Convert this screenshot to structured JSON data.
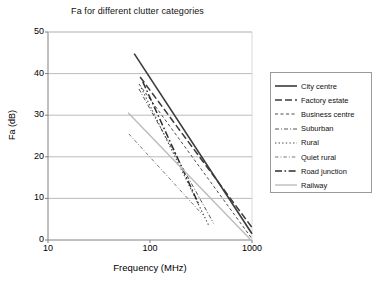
{
  "chart_data": {
    "type": "line",
    "title": "Fa for different clutter categories",
    "xlabel": "Frequency (MHz)",
    "ylabel": "Fa (dB)",
    "xscale": "log",
    "xlim": [
      10,
      1000
    ],
    "ylim": [
      0,
      50
    ],
    "xticks": [
      "10",
      "100",
      "1000"
    ],
    "yticks": [
      "0",
      "10",
      "20",
      "30",
      "40",
      "50"
    ],
    "grid": "horizontal",
    "legend_position": "right",
    "series": [
      {
        "name": "City centre",
        "style": "solid",
        "color": "#3b3b3b",
        "width": 1.6,
        "x": [
          70,
          1000
        ],
        "y": [
          44.8,
          1.5
        ]
      },
      {
        "name": "Factory estate",
        "style": "long-dash",
        "color": "#3b3b3b",
        "width": 1.5,
        "x": [
          80,
          1000
        ],
        "y": [
          39.2,
          3.0
        ]
      },
      {
        "name": "Business centre",
        "style": "dash",
        "color": "#4a4a4a",
        "width": 1.0,
        "x": [
          78,
          1000
        ],
        "y": [
          37.5,
          0.3
        ]
      },
      {
        "name": "Suburban",
        "style": "dash-dot",
        "color": "#555555",
        "width": 1.0,
        "x": [
          78,
          420
        ],
        "y": [
          36.3,
          4.0
        ]
      },
      {
        "name": "Rural",
        "style": "dot",
        "color": "#4a4a4a",
        "width": 1.1,
        "x": [
          82,
          380
        ],
        "y": [
          36.6,
          3.3
        ]
      },
      {
        "name": "Quiet rural",
        "style": "dash-dot-fine",
        "color": "#777777",
        "width": 1.0,
        "x": [
          62,
          330
        ],
        "y": [
          25.5,
          6.0
        ]
      },
      {
        "name": "Road junction",
        "style": "long-dash-dot",
        "color": "#2e2e2e",
        "width": 1.5,
        "x": [
          85,
          300
        ],
        "y": [
          38.0,
          8.6
        ]
      },
      {
        "name": "Railway",
        "style": "solid",
        "color": "#bcbcbc",
        "width": 1.4,
        "x": [
          61,
          960
        ],
        "y": [
          30.6,
          0.2
        ]
      }
    ]
  },
  "axes": {
    "y_tick_labels": [
      "50",
      "40",
      "30",
      "20",
      "10",
      "0"
    ],
    "x_tick_labels": [
      "10",
      "100",
      "1000"
    ]
  },
  "legend": {
    "items": [
      {
        "label": "City centre"
      },
      {
        "label": "Factory estate"
      },
      {
        "label": "Business centre"
      },
      {
        "label": "Suburban"
      },
      {
        "label": "Rural"
      },
      {
        "label": "Quiet rural"
      },
      {
        "label": "Road junction"
      },
      {
        "label": "Railway"
      }
    ]
  }
}
